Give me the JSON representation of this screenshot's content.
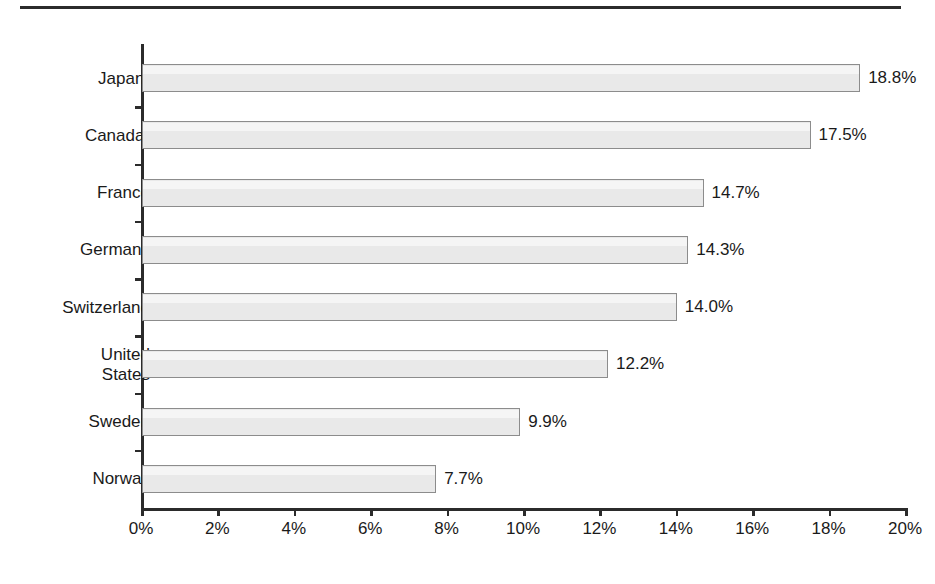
{
  "figure": {
    "has_top_rule": true,
    "background_color": "#ffffff",
    "bar_fill_color": "#e9e9e9",
    "bar_border_color": "#8c8c8c",
    "axis_color": "#2b2b2b",
    "text_color": "#1a1a1a"
  },
  "chart_data": {
    "type": "bar",
    "orientation": "horizontal",
    "title": "",
    "subtitle": "",
    "xlabel": "",
    "ylabel": "",
    "xlim": [
      0,
      20
    ],
    "xtick_step": 2,
    "grid": false,
    "legend": null,
    "value_label_suffix": "%",
    "categories": [
      "Japan",
      "Canada",
      "France",
      "Germany",
      "Switzerland",
      "United States",
      "Sweden",
      "Norway"
    ],
    "category_footnotes": [
      "a",
      "a",
      "",
      "",
      "",
      "",
      "",
      ""
    ],
    "values": [
      18.8,
      17.5,
      14.7,
      14.3,
      14.0,
      12.2,
      9.9,
      7.7
    ],
    "value_labels": [
      "18.8%",
      "17.5%",
      "14.7%",
      "14.3%",
      "14.0%",
      "12.2%",
      "9.9%",
      "7.7%"
    ],
    "xtick_labels": [
      "0%",
      "2%",
      "4%",
      "6%",
      "8%",
      "10%",
      "12%",
      "14%",
      "16%",
      "18%",
      "20%"
    ],
    "xtick_values": [
      0,
      2,
      4,
      6,
      8,
      10,
      12,
      14,
      16,
      18,
      20
    ]
  },
  "rows": [
    {
      "label_line1": "Japan",
      "label_line2": "",
      "footnote": "a",
      "value_label": "18.8%",
      "value": 18.8
    },
    {
      "label_line1": "Canada",
      "label_line2": "",
      "footnote": "a",
      "value_label": "17.5%",
      "value": 17.5
    },
    {
      "label_line1": "France",
      "label_line2": "",
      "footnote": "",
      "value_label": "14.7%",
      "value": 14.7
    },
    {
      "label_line1": "Germany",
      "label_line2": "",
      "footnote": "",
      "value_label": "14.3%",
      "value": 14.3
    },
    {
      "label_line1": "Switzerland",
      "label_line2": "",
      "footnote": "",
      "value_label": "14.0%",
      "value": 14.0
    },
    {
      "label_line1": "United",
      "label_line2": "States",
      "footnote": "",
      "value_label": "12.2%",
      "value": 12.2
    },
    {
      "label_line1": "Sweden",
      "label_line2": "",
      "footnote": "",
      "value_label": "9.9%",
      "value": 9.9
    },
    {
      "label_line1": "Norway",
      "label_line2": "",
      "footnote": "",
      "value_label": "7.7%",
      "value": 7.7
    }
  ]
}
